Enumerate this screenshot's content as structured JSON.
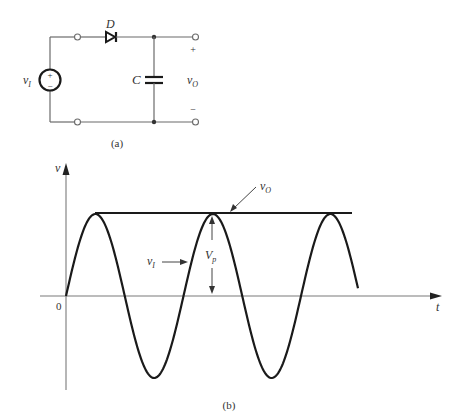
{
  "circuit": {
    "source_label": "v",
    "source_sub": "I",
    "source_plus": "+",
    "source_minus": "−",
    "diode_label": "D",
    "capacitor_label": "C",
    "output_label": "v",
    "output_sub": "O",
    "output_plus": "+",
    "output_minus": "−",
    "caption": "(a)"
  },
  "graph": {
    "y_axis_label": "v",
    "x_axis_label": "t",
    "origin_label": "0",
    "vo_label": "v",
    "vo_sub": "O",
    "vi_label": "v",
    "vi_sub": "I",
    "vp_label": "V",
    "vp_sub": "p",
    "caption": "(b)"
  },
  "chart_data": {
    "type": "line",
    "xlabel": "t",
    "ylabel": "v",
    "series": [
      {
        "name": "vI",
        "description": "sinusoidal input, amplitude Vp, ~2.5 cycles starting at 0"
      },
      {
        "name": "vO",
        "description": "output held constant at Vp after first peak"
      }
    ],
    "annotations": [
      "Vp (peak amplitude)",
      "0 (origin)"
    ]
  },
  "colors": {
    "wire": "#6b6b6b",
    "waveform": "#1a1a1a",
    "text": "#333333"
  }
}
